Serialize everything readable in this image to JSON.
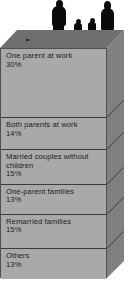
{
  "illustration": {
    "title": "Family types stacked block diagram",
    "figures": [
      {
        "name": "adult-male-silhouette"
      },
      {
        "name": "child-silhouette-1"
      },
      {
        "name": "child-silhouette-2"
      },
      {
        "name": "adult-female-silhouette"
      }
    ],
    "colors": {
      "front_face": "#a9a9a9",
      "top_face": "#6f6f6f",
      "side_face": "#808080",
      "outline": "#3d3d3d",
      "silhouette": "#0a0a0a",
      "text": "#1d1d1d",
      "background": "#ffffff"
    }
  },
  "caption": "",
  "chart_data": {
    "type": "bar",
    "title": "",
    "subtitle": "",
    "xlabel": "",
    "ylabel": "",
    "orientation": "stacked-vertical-3d",
    "units": "percent",
    "legend_position": "in-segment",
    "grid": false,
    "categories": [
      "One parent at work",
      "Both parents at work",
      "Married couples without children",
      "One-parent families",
      "Remarried families",
      "Others"
    ],
    "values": [
      30,
      14,
      15,
      13,
      15,
      13
    ],
    "ylim": [
      0,
      100
    ],
    "segments": [
      {
        "label": "One parent at work",
        "value": 30,
        "value_label": "30%"
      },
      {
        "label": "Both parents at work",
        "value": 14,
        "value_label": "14%"
      },
      {
        "label": "Married couples without children",
        "value": 15,
        "value_label": "15%"
      },
      {
        "label": "One-parent families",
        "value": 13,
        "value_label": "13%"
      },
      {
        "label": "Remarried families",
        "value": 15,
        "value_label": "15%"
      },
      {
        "label": "Others",
        "value": 13,
        "value_label": "13%"
      }
    ]
  }
}
